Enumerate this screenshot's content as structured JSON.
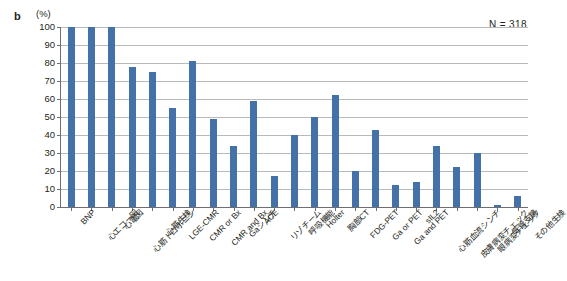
{
  "figure": {
    "panel_letter": "b",
    "unit_label": "(%)",
    "n_annotation": "N = 318"
  },
  "chart_data": {
    "type": "bar",
    "title": "",
    "subtitle": "",
    "xlabel": "",
    "ylabel": "(%)",
    "ylim": [
      0,
      100
    ],
    "yticks": [
      0,
      10,
      20,
      30,
      40,
      50,
      60,
      70,
      80,
      90,
      100
    ],
    "ytick_labels": [
      "0",
      "10",
      "20",
      "30",
      "40",
      "50",
      "60",
      "70",
      "80",
      "90",
      "100"
    ],
    "grid": true,
    "legend": null,
    "annotations": [
      "N = 318"
    ],
    "bar_color": "#4472a8",
    "categories": [
      "BNP",
      "心エコー図",
      "心電図",
      "心筋トロポニン",
      "心筋生検",
      "LGE-CMR",
      "CMR or Bx",
      "CMR and Bx",
      "Gaシンチ",
      "ACE",
      "リゾチーム",
      "呼吸機能",
      "Holter",
      "胸部CT",
      "FDG-PET",
      "Ga or PET",
      "Ga and PET",
      "sIL2",
      "心筋血流シンチ",
      "皮膚病変チェック",
      "眼病変チェック",
      "気管支鏡",
      "その他生検"
    ],
    "values": [
      100,
      100,
      100,
      78,
      75,
      55,
      81,
      49,
      34,
      59,
      17,
      40,
      50,
      62,
      20,
      43,
      12,
      14,
      34,
      22,
      30,
      1,
      6
    ]
  }
}
